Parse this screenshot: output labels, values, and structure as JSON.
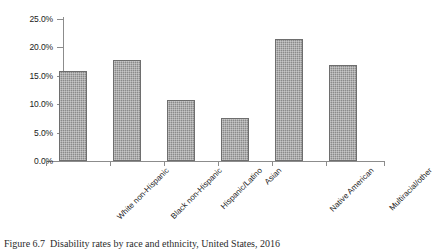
{
  "figure": {
    "caption_prefix": "Figure 6.7",
    "caption_text": "Disability rates by race and ethnicity, United States, 2016"
  },
  "chart_data": {
    "type": "bar",
    "title": "",
    "xlabel": "",
    "ylabel": "",
    "categories": [
      "White non-Hispanic",
      "Black non-Hispanic",
      "Hispanic/Latino",
      "Asian",
      "Native American",
      "Multiracial/other"
    ],
    "values": [
      15.9,
      17.8,
      10.7,
      7.6,
      21.5,
      16.9
    ],
    "value_labels": [
      "15.9%",
      "17.8%",
      "10.7%",
      "7.6%",
      "21.5%",
      "16.9%"
    ],
    "ylim": [
      0,
      25
    ],
    "ytick_values": [
      0,
      5,
      10,
      15,
      20,
      25
    ],
    "ytick_labels": [
      "0.0%",
      "5.0%",
      "10.0%",
      "15.0%",
      "20.0%",
      "25.0%"
    ],
    "grid": false,
    "legend": null,
    "legend_position": "none",
    "bar_color": "#8a8a8a",
    "bar_edge_color": "#6e6e6e",
    "axis_color": "#8c8c8c",
    "units": "percent"
  }
}
